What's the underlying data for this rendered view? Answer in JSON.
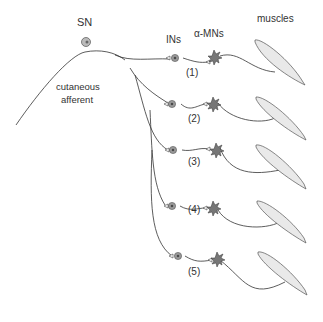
{
  "labels": {
    "sensory_neuron": "SN",
    "afferent_line1": "cutaneous",
    "afferent_line2": "afferent",
    "interneurons": "INs",
    "motoneurons": "α-MNs",
    "muscles": "muscles"
  },
  "pathways": [
    {
      "id": "(1)"
    },
    {
      "id": "(2)"
    },
    {
      "id": "(3)"
    },
    {
      "id": "(4)"
    },
    {
      "id": "(5)"
    }
  ],
  "colors": {
    "line": "#333333",
    "cell_fill": "#9a9a9a",
    "muscle_fill": "#e8e8e8",
    "text": "#333333"
  }
}
